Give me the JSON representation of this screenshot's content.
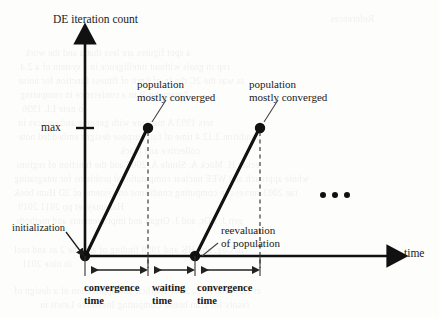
{
  "figure": {
    "background_color": "#fdfdfc",
    "ink_color": "#111111",
    "axes": {
      "y_axis_label": "DE iteration count",
      "x_axis_label": "time",
      "y_tick_label": "max",
      "y_axis_x": 85,
      "x_axis_y": 256,
      "y_axis_top": 33,
      "x_axis_right": 398
    },
    "annotations": {
      "initialization": "initialization",
      "population_converged_1": "population\nmostly converged",
      "population_converged_2": "population\nmostly converged",
      "reevaluation": "reevaluation\nof population",
      "continuation_ellipsis": "•••"
    },
    "interval_labels": [
      {
        "name": "convergence-time-1",
        "line1": "convergence",
        "line2": "time",
        "from_x": 85,
        "to_x": 148
      },
      {
        "name": "waiting-time",
        "line1": "waiting",
        "line2": "time",
        "from_x": 148,
        "to_x": 195
      },
      {
        "name": "convergence-time-2",
        "line1": "convergence",
        "line2": "time",
        "from_x": 195,
        "to_x": 260
      }
    ]
  },
  "chart_data": {
    "type": "line",
    "title": "",
    "xlabel": "time",
    "ylabel": "DE iteration count",
    "ytick_labels": [
      "max"
    ],
    "ytick_values": [
      128
    ],
    "grid": false,
    "legend": "none",
    "xlim": [
      85,
      398
    ],
    "ylim": [
      256,
      33
    ],
    "series": [
      {
        "name": "run-1",
        "points": [
          {
            "x": 85,
            "y": 256
          },
          {
            "x": 148,
            "y": 128
          }
        ],
        "markers": [
          {
            "x": 85,
            "y": 256,
            "label": "initialization"
          },
          {
            "x": 148,
            "y": 128,
            "label": "population mostly converged"
          }
        ]
      },
      {
        "name": "run-2",
        "points": [
          {
            "x": 195,
            "y": 256
          },
          {
            "x": 260,
            "y": 128
          }
        ],
        "markers": [
          {
            "x": 195,
            "y": 256,
            "label": "reevaluation of population"
          },
          {
            "x": 260,
            "y": 128,
            "label": "population mostly converged"
          }
        ]
      }
    ],
    "dashed_droplines_x": [
      148,
      260
    ],
    "annotations": [
      {
        "text": "population mostly converged",
        "target_x": 148,
        "target_y": 128
      },
      {
        "text": "population mostly converged",
        "target_x": 260,
        "target_y": 128
      },
      {
        "text": "initialization",
        "target_x": 85,
        "target_y": 256
      },
      {
        "text": "reevaluation of population",
        "target_x": 195,
        "target_y": 256
      },
      {
        "text": "•••",
        "target_x": 337,
        "target_y": 196
      }
    ]
  },
  "ghost_text": [
    {
      "text": "References",
      "x": 330,
      "y": 14
    },
    {
      "text": "a spot figures are  less that a and the work",
      "x": 25,
      "y": 48
    },
    {
      "text": "rep in goals without intelligence in a system of a 2.4",
      "x": 20,
      "y": 62
    },
    {
      "text": "as was the 2C  the  In  of  limit    of  fitness function for  noise",
      "x": 18,
      "y": 76
    },
    {
      "text": "Parameter  B  in  a  conference  in  computing",
      "x": 20,
      "y": 90
    },
    {
      "text": "to   note  LL   1996",
      "x": 22,
      "y": 104
    },
    {
      "text": "ters  1993  A  measure  with  genome  and  sources  in",
      "x": 18,
      "y": 118
    },
    {
      "text": "condition  3.12.4   time  of  full  purpose  designs  embedded  note",
      "x": 18,
      "y": 132
    },
    {
      "text": "collective  and  black",
      "x": 120,
      "y": 146
    },
    {
      "text": "ecker  H.  Mock  A.  Sinnle  A.  2007  and  the  function  of  regions",
      "x": 16,
      "y": 160
    },
    {
      "text": "whole  approach  and  WEE  nuclear  computational  problems  for  integrating",
      "x": 14,
      "y": 174
    },
    {
      "text": "rae  2003  surveys  in  computing  conditions  on  systems  of  3D  Hum  book",
      "x": 14,
      "y": 188
    },
    {
      "text": "Hansmay,  et  pp  2011  2019",
      "x": 18,
      "y": 202
    },
    {
      "text": "gen  J.  I  Dr,  and  J.  Organ  and  improvements  and  methods",
      "x": 16,
      "y": 216
    },
    {
      "text": "in  Cog,  and  HK  and  1998  finding  of  and  the  2  as  and  tool",
      "x": 14,
      "y": 245
    },
    {
      "text": "in  nine  2011",
      "x": 22,
      "y": 259
    },
    {
      "text": "rs  D.  Moon  A.  L.  2001  Implicit  and  application  of  a  design  of",
      "x": 14,
      "y": 286
    },
    {
      "text": "resolv  for  L  an  house  Computing  Inventive  Lewis  in",
      "x": 40,
      "y": 300
    }
  ]
}
